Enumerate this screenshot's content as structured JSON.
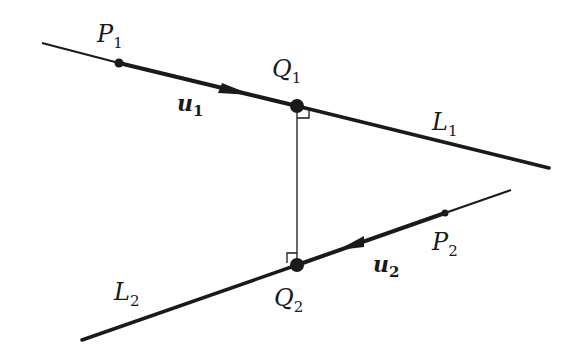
{
  "diagram": {
    "lines": [
      {
        "id": "L1",
        "label": "L",
        "subscript": "1"
      },
      {
        "id": "L2",
        "label": "L",
        "subscript": "2"
      }
    ],
    "points": [
      {
        "id": "P1",
        "label": "P",
        "subscript": "1"
      },
      {
        "id": "Q1",
        "label": "Q",
        "subscript": "1"
      },
      {
        "id": "P2",
        "label": "P",
        "subscript": "2"
      },
      {
        "id": "Q2",
        "label": "Q",
        "subscript": "2"
      }
    ],
    "vectors": [
      {
        "id": "u1",
        "label": "u",
        "subscript": "1",
        "direction": "along L1 toward Q1"
      },
      {
        "id": "u2",
        "label": "u",
        "subscript": "2",
        "direction": "along L2 toward Q2"
      }
    ],
    "segment": {
      "id": "Q1Q2",
      "note": "common perpendicular, right angles at Q1 and Q2"
    },
    "colors": {
      "ink": "#1a1a1a",
      "background": "#ffffff"
    }
  }
}
